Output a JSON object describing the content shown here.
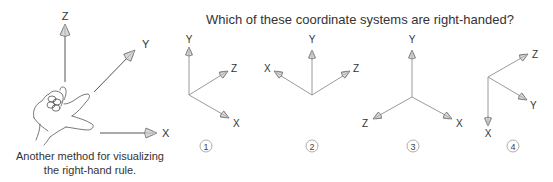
{
  "title": "Which of these coordinate systems are right-handed?",
  "hand_figure": {
    "axes": {
      "x": "X",
      "y": "Y",
      "z": "Z"
    },
    "caption_line1": "Another method for visualizing",
    "caption_line2": "the right-hand rule."
  },
  "systems": [
    {
      "number": "1",
      "x": "X",
      "y": "Y",
      "z": "Z"
    },
    {
      "number": "2",
      "x": "X",
      "y": "Y",
      "z": "Z"
    },
    {
      "number": "3",
      "x": "X",
      "y": "Y",
      "z": "Z"
    },
    {
      "number": "4",
      "x": "X",
      "y": "Y",
      "z": "Z"
    }
  ],
  "colors": {
    "line": "#9a9a9a",
    "text": "#333333",
    "background": "#ffffff"
  }
}
